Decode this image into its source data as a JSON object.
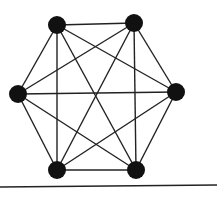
{
  "diagram": {
    "type": "complete-graph",
    "name": "K6",
    "node_color": "#111111",
    "edge_color": "#222222",
    "node_radius": 9,
    "nodes": [
      {
        "id": "top-left",
        "x": 57,
        "y": 25
      },
      {
        "id": "top-right",
        "x": 134,
        "y": 23
      },
      {
        "id": "right",
        "x": 176,
        "y": 92
      },
      {
        "id": "bottom-right",
        "x": 136,
        "y": 170
      },
      {
        "id": "bottom-left",
        "x": 57,
        "y": 170
      },
      {
        "id": "left",
        "x": 18,
        "y": 94
      }
    ],
    "baseline": {
      "x1": 0,
      "y1": 187,
      "x2": 217,
      "y2": 185
    }
  }
}
